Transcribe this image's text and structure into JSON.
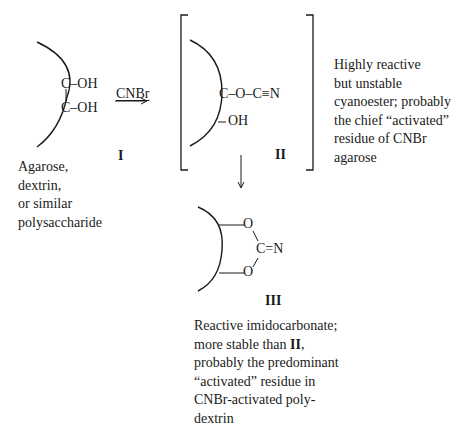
{
  "diagram": {
    "reagent": "CNBr",
    "structures": [
      {
        "id": "I",
        "label": "I",
        "groups": [
          "C–OH",
          "C–OH"
        ],
        "bond_vertical": "|",
        "caption_lines": [
          "Agarose,",
          "dextrin,",
          "or similar",
          "polysaccharide"
        ]
      },
      {
        "id": "II",
        "label": "II",
        "groups": [
          "C–O–C≡N",
          "OH"
        ],
        "caption_lines": [
          "Highly reactive",
          "but unstable",
          "cyanoester; probably",
          "the chief “activated”",
          "residue of CNBr",
          "agarose"
        ]
      },
      {
        "id": "III",
        "label": "III",
        "atoms": {
          "o_top": "O",
          "c_imino": "C=N",
          "o_bottom": "O"
        },
        "caption_lines": [
          {
            "text_before": "Reactive imidocarbonate;"
          },
          {
            "text_before": "more stable than ",
            "bold": "II",
            "text_after": ","
          },
          {
            "text_before": "probably the predominant"
          },
          {
            "text_before": "“activated” residue in"
          },
          {
            "text_before": "CNBr-activated poly-"
          },
          {
            "text_before": "dextrin"
          }
        ]
      }
    ],
    "colors": {
      "ink": "#1a1a1a",
      "background": "#ffffff"
    }
  }
}
